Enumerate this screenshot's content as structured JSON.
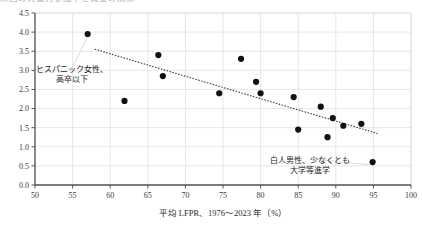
{
  "figure": {
    "title_sliver": "米国の労働力参加率と賃金の関係",
    "background_color": "#ffffff",
    "point_color": "#111111",
    "grid_color": "#dcdcdc",
    "axis_color": "#555555",
    "trend_color": "#444444"
  },
  "chart_data": {
    "type": "scatter",
    "title": "",
    "xlabel": "平均 LFPR、1976〜2023 年（%）",
    "ylabel": "",
    "xlim": [
      50,
      100
    ],
    "ylim": [
      0.0,
      4.5
    ],
    "xticks": [
      50,
      55,
      60,
      65,
      70,
      75,
      80,
      85,
      90,
      95,
      100
    ],
    "xtick_labels": [
      "50",
      "55",
      "60",
      "65",
      "70",
      "75",
      "80",
      "85",
      "90",
      "95",
      "100"
    ],
    "yticks": [
      0.0,
      0.5,
      1.0,
      1.5,
      2.0,
      2.5,
      3.0,
      3.5,
      4.0,
      4.5
    ],
    "ytick_labels": [
      "0.0",
      "0.5",
      "1.0",
      "1.5",
      "2.0",
      "2.5",
      "3.0",
      "3.5",
      "4.0",
      "4.5"
    ],
    "grid": true,
    "grid_axis": "both",
    "legend": false,
    "legend_position": "none",
    "points": [
      {
        "x": 57.0,
        "y": 3.95
      },
      {
        "x": 61.9,
        "y": 2.2
      },
      {
        "x": 66.4,
        "y": 3.4
      },
      {
        "x": 67.0,
        "y": 2.85
      },
      {
        "x": 74.5,
        "y": 2.4
      },
      {
        "x": 77.4,
        "y": 3.3
      },
      {
        "x": 79.4,
        "y": 2.7
      },
      {
        "x": 80.0,
        "y": 2.4
      },
      {
        "x": 84.4,
        "y": 2.3
      },
      {
        "x": 85.0,
        "y": 1.45
      },
      {
        "x": 88.0,
        "y": 2.05
      },
      {
        "x": 88.9,
        "y": 1.25
      },
      {
        "x": 89.6,
        "y": 1.75
      },
      {
        "x": 91.0,
        "y": 1.55
      },
      {
        "x": 93.4,
        "y": 1.6
      },
      {
        "x": 94.9,
        "y": 0.6
      }
    ],
    "trendline": {
      "style": "dotted",
      "x_start": 58.0,
      "y_start": 3.55,
      "x_end": 95.5,
      "y_end": 1.35
    },
    "annotations": [
      {
        "id": "hispanic-women",
        "lines": [
          "ヒスパニック女性、",
          "高卒以下"
        ],
        "x": 57.0,
        "y": 3.95,
        "label_cx": 72,
        "label_cy": 72
      },
      {
        "id": "white-men",
        "lines": [
          "白人男性、少なくとも",
          "大学等進学"
        ],
        "x": 94.9,
        "y": 0.6,
        "label_cx": 310,
        "label_cy": 163
      }
    ]
  }
}
